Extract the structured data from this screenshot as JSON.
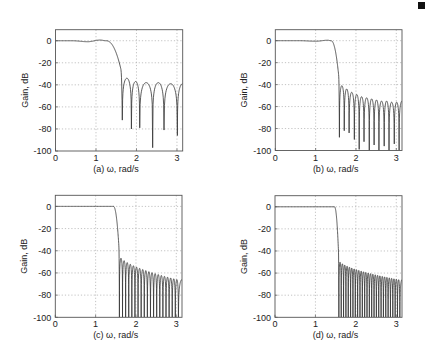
{
  "figure": {
    "ylabel": "Gain, dB",
    "xlabel": "ω, rad/s",
    "xticks": [
      0,
      1,
      2,
      3
    ],
    "yticks": [
      0,
      -20,
      -40,
      -60,
      -80,
      -100
    ],
    "xlim": [
      0,
      3.1416
    ],
    "ylim": [
      -100,
      10
    ]
  },
  "chart_data": [
    {
      "type": "line",
      "panel": "(a)",
      "title": "",
      "xlabel": "ω, rad/s",
      "ylabel": "Gain, dB",
      "xlim": [
        0,
        3.1416
      ],
      "ylim": [
        -100,
        10
      ],
      "grid": true,
      "passband": {
        "edge": 1.25,
        "ripple": [
          [
            0,
            0
          ],
          [
            0.4,
            0
          ],
          [
            0.8,
            -0.9
          ],
          [
            1.1,
            0.6
          ],
          [
            1.25,
            0
          ]
        ]
      },
      "nulls": [
        {
          "w": 1.65,
          "db": -72
        },
        {
          "w": 1.875,
          "db": -80
        },
        {
          "w": 2.08,
          "db": -79
        },
        {
          "w": 2.4,
          "db": -97
        },
        {
          "w": 2.68,
          "db": -81
        },
        {
          "w": 3.01,
          "db": -86
        }
      ],
      "lobe_peaks": [
        -30,
        -34,
        -37,
        -38,
        -38,
        -39
      ],
      "end_db": -39
    },
    {
      "type": "line",
      "panel": "(b)",
      "title": "",
      "xlabel": "ω, rad/s",
      "ylabel": "Gain, dB",
      "xlim": [
        0,
        3.1416
      ],
      "ylim": [
        -100,
        10
      ],
      "grid": true,
      "passband": {
        "edge": 1.38,
        "ripple": [
          [
            0,
            0
          ],
          [
            0.6,
            0
          ],
          [
            1.0,
            -0.5
          ],
          [
            1.3,
            0.4
          ],
          [
            1.38,
            0
          ]
        ]
      },
      "nulls": [
        {
          "w": 1.59,
          "db": -88
        },
        {
          "w": 1.71,
          "db": -82
        },
        {
          "w": 1.83,
          "db": -84
        },
        {
          "w": 1.96,
          "db": -90
        },
        {
          "w": 2.08,
          "db": -99
        },
        {
          "w": 2.2,
          "db": -92
        },
        {
          "w": 2.33,
          "db": -100
        },
        {
          "w": 2.45,
          "db": -95
        },
        {
          "w": 2.57,
          "db": -100
        },
        {
          "w": 2.7,
          "db": -96
        },
        {
          "w": 2.82,
          "db": -100
        },
        {
          "w": 2.95,
          "db": -94
        },
        {
          "w": 3.07,
          "db": -100
        }
      ],
      "lobe_peaks": [
        -37,
        -41,
        -44,
        -47,
        -49,
        -51,
        -52,
        -53,
        -54,
        -55,
        -55,
        -56,
        -56
      ],
      "end_db": -55
    },
    {
      "type": "line",
      "panel": "(c)",
      "title": "",
      "xlabel": "ω, rad/s",
      "ylabel": "Gain, dB",
      "xlim": [
        0,
        3.1416
      ],
      "ylim": [
        -100,
        10
      ],
      "grid": true,
      "passband": {
        "edge": 1.44,
        "ripple": [
          [
            0,
            0
          ],
          [
            1.44,
            0
          ]
        ]
      },
      "nulls_start": 1.59,
      "nulls_spacing": 0.077,
      "nulls_count": 20,
      "null_depth": -100,
      "lobe_peak_start": -42,
      "lobe_peak_end": -66,
      "end_db": -66
    },
    {
      "type": "line",
      "panel": "(d)",
      "title": "",
      "xlabel": "ω, rad/s",
      "ylabel": "Gain, dB",
      "xlim": [
        0,
        3.1416
      ],
      "ylim": [
        -100,
        10
      ],
      "grid": true,
      "passband": {
        "edge": 1.47,
        "ripple": [
          [
            0,
            0
          ],
          [
            1.47,
            0
          ]
        ]
      },
      "nulls_start": 1.58,
      "nulls_spacing": 0.058,
      "nulls_count": 27,
      "null_depth": -100,
      "lobe_peak_start": -47,
      "lobe_peak_end": -66,
      "end_db": -66
    }
  ],
  "panels": [
    {
      "label": "(a)",
      "box": [
        55.5,
        29.7,
        127.2,
        121.3
      ]
    },
    {
      "label": "(b)",
      "box": [
        275.3,
        29.7,
        126.7,
        120.8
      ]
    },
    {
      "label": "(c)",
      "box": [
        55.3,
        195.3,
        126.7,
        122.0
      ]
    },
    {
      "label": "(d)",
      "box": [
        275.0,
        195.7,
        127.0,
        121.6
      ]
    }
  ]
}
